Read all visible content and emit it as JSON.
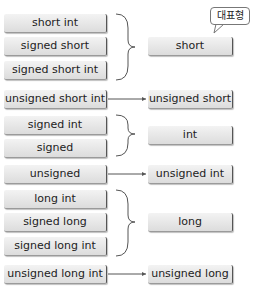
{
  "groups": [
    {
      "sources": [
        "short int",
        "signed short",
        "signed short int"
      ],
      "target": "short",
      "connector": "brace"
    },
    {
      "sources": [
        "unsigned short int"
      ],
      "target": "unsigned short",
      "connector": "arrow"
    },
    {
      "sources": [
        "signed int",
        "signed"
      ],
      "target": "int",
      "connector": "brace"
    },
    {
      "sources": [
        "unsigned"
      ],
      "target": "unsigned int",
      "connector": "arrow"
    },
    {
      "sources": [
        "long int",
        "signed long",
        "signed long int"
      ],
      "target": "long",
      "connector": "brace"
    },
    {
      "sources": [
        "unsigned long int"
      ],
      "target": "unsigned long",
      "connector": "arrow"
    }
  ],
  "callout": "대표형",
  "colors": {
    "box_fill": "#e6e6e6",
    "box_edge": "#555555",
    "line": "#555555"
  }
}
